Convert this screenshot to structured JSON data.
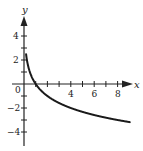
{
  "chart_data": {
    "type": "line",
    "title": "",
    "function": "y = -log2(x)",
    "xlabel": "x",
    "ylabel": "y",
    "xlim": [
      0,
      9
    ],
    "ylim": [
      -5,
      5
    ],
    "grid": false,
    "x_ticks": [
      1,
      2,
      3,
      4,
      5,
      6,
      7,
      8
    ],
    "x_tick_labels": [
      "0",
      "4",
      "6",
      "8"
    ],
    "y_ticks": [
      -4,
      -3,
      -2,
      -1,
      1,
      2,
      3,
      4
    ],
    "y_tick_labels": [
      "4",
      "2",
      "−2",
      "−4"
    ],
    "series": [
      {
        "name": "curve",
        "x": [
          0.05,
          0.1,
          0.25,
          0.5,
          1,
          2,
          3,
          4,
          5,
          6,
          7,
          8,
          9
        ],
        "y": [
          4.32,
          3.32,
          2,
          1,
          0,
          -1,
          -1.58,
          -2,
          -2.32,
          -2.58,
          -2.81,
          -3,
          -3.17
        ]
      }
    ]
  },
  "labels": {
    "x_axis": "x",
    "y_axis": "y",
    "origin": "0",
    "x4": "4",
    "x6": "6",
    "x8": "8",
    "y4": "4",
    "y2": "2",
    "yn2": "−2",
    "yn4": "−4"
  }
}
